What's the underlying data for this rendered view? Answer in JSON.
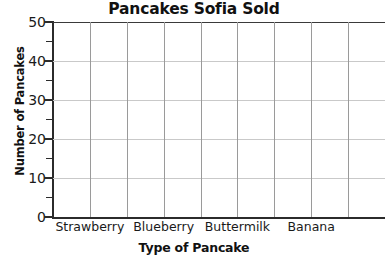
{
  "chart_data": {
    "type": "bar",
    "title": "Pancakes Sofia Sold",
    "xlabel": "Type of Pancake",
    "ylabel": "Number of Pancakes",
    "categories": [
      "Strawberry",
      "Blueberry",
      "Buttermilk",
      "Banana"
    ],
    "values": [
      null,
      null,
      null,
      null
    ],
    "series": [
      {
        "name": "Pancakes Sold",
        "values": [
          null,
          null,
          null,
          null
        ]
      }
    ],
    "ylim": [
      0,
      50
    ],
    "ytick_labels": [
      "0",
      "10",
      "20",
      "30",
      "40",
      "50"
    ],
    "ytick_values": [
      0,
      10,
      20,
      30,
      40,
      50
    ],
    "yminor_tick_values": [
      5,
      15,
      25,
      35,
      45
    ],
    "grid": "both",
    "vertical_gridline_count": 8,
    "legend": null,
    "note": "blank grid - no bars plotted",
    "colors": {
      "text": "#111111",
      "axis": "#2b2b2b",
      "hgrid": "#c9c9c9",
      "vgrid": "#9a9a9a",
      "background": "#ffffff"
    }
  }
}
